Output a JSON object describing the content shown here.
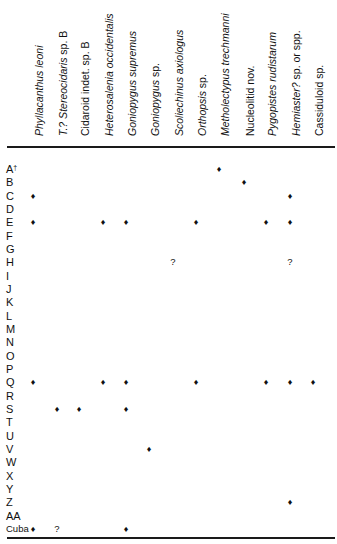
{
  "columns": [
    {
      "id": "phyllacanthus",
      "x": 33,
      "parts": [
        {
          "text": "Phyllacanthus leoni",
          "italic": true
        }
      ]
    },
    {
      "id": "stereocidaris",
      "x": 57,
      "parts": [
        {
          "text": "T.? Stereocidaris",
          "italic": true
        },
        {
          "text": " sp. B",
          "italic": false
        }
      ]
    },
    {
      "id": "cidaroid",
      "x": 79,
      "parts": [
        {
          "text": "Cidaroid indet. sp. B",
          "italic": false
        }
      ]
    },
    {
      "id": "heterosalenia",
      "x": 103,
      "parts": [
        {
          "text": "Heterosalenia occidentalis",
          "italic": true
        }
      ]
    },
    {
      "id": "goniopygus-supremus",
      "x": 126,
      "parts": [
        {
          "text": "Goniopygus supremus",
          "italic": true
        }
      ]
    },
    {
      "id": "goniopygus-sp",
      "x": 149,
      "parts": [
        {
          "text": "Goniopygus",
          "italic": true
        },
        {
          "text": " sp.",
          "italic": false
        }
      ]
    },
    {
      "id": "scoliechinus",
      "x": 173,
      "parts": [
        {
          "text": "Scoliechinus axiologus",
          "italic": true
        }
      ]
    },
    {
      "id": "orthopsis",
      "x": 196,
      "parts": [
        {
          "text": "Orthopsis",
          "italic": true
        },
        {
          "text": " sp.",
          "italic": false
        }
      ]
    },
    {
      "id": "metholectypus",
      "x": 219,
      "parts": [
        {
          "text": "Metholectypus trechmanni",
          "italic": true
        }
      ]
    },
    {
      "id": "nucleolitid",
      "x": 244,
      "parts": [
        {
          "text": "Nucleolitid nov.",
          "italic": false
        }
      ]
    },
    {
      "id": "pygopistes",
      "x": 266,
      "parts": [
        {
          "text": "Pygopistes rudistarum",
          "italic": true
        }
      ]
    },
    {
      "id": "hemiaster",
      "x": 290,
      "parts": [
        {
          "text": "Hemiaster?",
          "italic": true
        },
        {
          "text": " sp. or spp.",
          "italic": false
        }
      ]
    },
    {
      "id": "cassiduloid",
      "x": 313,
      "parts": [
        {
          "text": "Cassiduloid sp.",
          "italic": false
        }
      ]
    }
  ],
  "rows": [
    {
      "label": "A",
      "sup": "†",
      "marks": [
        {
          "col": "metholectypus",
          "sym": "♦"
        }
      ]
    },
    {
      "label": "B",
      "marks": [
        {
          "col": "nucleolitid",
          "sym": "♦"
        }
      ]
    },
    {
      "label": "C",
      "marks": [
        {
          "col": "phyllacanthus",
          "sym": "♦"
        },
        {
          "col": "hemiaster",
          "sym": "♦"
        }
      ]
    },
    {
      "label": "D",
      "marks": []
    },
    {
      "label": "E",
      "marks": [
        {
          "col": "phyllacanthus",
          "sym": "♦"
        },
        {
          "col": "heterosalenia",
          "sym": "♦"
        },
        {
          "col": "goniopygus-supremus",
          "sym": "♦"
        },
        {
          "col": "orthopsis",
          "sym": "♦"
        },
        {
          "col": "pygopistes",
          "sym": "♦"
        },
        {
          "col": "hemiaster",
          "sym": "♦"
        }
      ]
    },
    {
      "label": "F",
      "marks": []
    },
    {
      "label": "G",
      "marks": []
    },
    {
      "label": "H",
      "marks": [
        {
          "col": "scoliechinus",
          "sym": "?"
        },
        {
          "col": "hemiaster",
          "sym": "?"
        }
      ]
    },
    {
      "label": "I",
      "marks": []
    },
    {
      "label": "J",
      "marks": []
    },
    {
      "label": "K",
      "marks": []
    },
    {
      "label": "L",
      "marks": []
    },
    {
      "label": "M",
      "marks": []
    },
    {
      "label": "N",
      "marks": []
    },
    {
      "label": "O",
      "marks": []
    },
    {
      "label": "P",
      "marks": []
    },
    {
      "label": "Q",
      "marks": [
        {
          "col": "phyllacanthus",
          "sym": "♦"
        },
        {
          "col": "heterosalenia",
          "sym": "♦"
        },
        {
          "col": "goniopygus-supremus",
          "sym": "♦"
        },
        {
          "col": "orthopsis",
          "sym": "♦"
        },
        {
          "col": "pygopistes",
          "sym": "♦"
        },
        {
          "col": "hemiaster",
          "sym": "♦"
        },
        {
          "col": "cassiduloid",
          "sym": "♦"
        }
      ]
    },
    {
      "label": "R",
      "marks": []
    },
    {
      "label": "S",
      "marks": [
        {
          "col": "stereocidaris",
          "sym": "♦"
        },
        {
          "col": "cidaroid",
          "sym": "♦"
        },
        {
          "col": "goniopygus-supremus",
          "sym": "♦"
        }
      ]
    },
    {
      "label": "T",
      "marks": []
    },
    {
      "label": "U",
      "marks": []
    },
    {
      "label": "V",
      "marks": [
        {
          "col": "goniopygus-sp",
          "sym": "♦"
        }
      ]
    },
    {
      "label": "W",
      "marks": []
    },
    {
      "label": "X",
      "marks": []
    },
    {
      "label": "Y",
      "marks": []
    },
    {
      "label": "Z",
      "marks": [
        {
          "col": "hemiaster",
          "sym": "♦"
        }
      ]
    },
    {
      "label": "AA",
      "marks": []
    },
    {
      "label": "Cuba",
      "small": true,
      "marks": [
        {
          "col": "phyllacanthus",
          "sym": "♦"
        },
        {
          "col": "stereocidaris",
          "sym": "?"
        },
        {
          "col": "goniopygus-supremus",
          "sym": "♦"
        }
      ]
    }
  ],
  "layout": {
    "row_start_y": 163,
    "row_step": 13.33
  }
}
